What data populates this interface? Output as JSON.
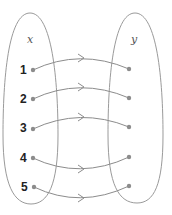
{
  "diagram": {
    "type": "mapping",
    "domain_set": {
      "label": "x",
      "elements": [
        "1",
        "2",
        "3",
        "4",
        "5"
      ]
    },
    "codomain_set": {
      "label": "y",
      "elements_count": 5
    },
    "arrows": [
      {
        "from": "1",
        "to": 1
      },
      {
        "from": "2",
        "to": 2
      },
      {
        "from": "3",
        "to": 3
      },
      {
        "from": "4",
        "to": 4
      },
      {
        "from": "5",
        "to": 5
      }
    ],
    "colors": {
      "outline": "#999999",
      "point": "#8c8c8c",
      "arrow": "#8c8c8c",
      "number_text": "#222222"
    }
  }
}
